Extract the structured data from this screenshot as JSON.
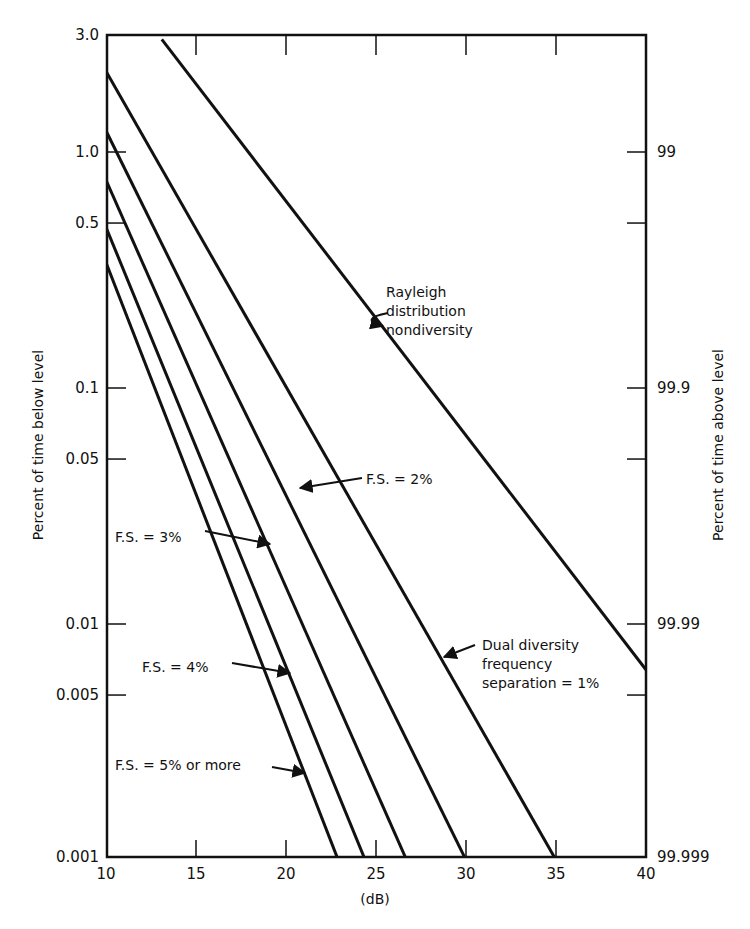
{
  "chart_data": {
    "type": "line",
    "title": "",
    "xlabel": "(dB)",
    "ylabel": "Percent of time below level",
    "ylabel_right": "Percent of time above level",
    "xlim": [
      10,
      40
    ],
    "ylim": [
      0.001,
      3.0
    ],
    "yscale": "log",
    "grid": false,
    "x_ticks": [
      10,
      15,
      20,
      25,
      30,
      35,
      40
    ],
    "x_tick_labels": [
      "10",
      "15",
      "20",
      "25",
      "30",
      "35",
      "40"
    ],
    "y_ticks": [
      3.0,
      1.0,
      0.5,
      0.1,
      0.05,
      0.01,
      0.005,
      0.001
    ],
    "y_tick_labels": [
      "3.0",
      "1.0",
      "0.5",
      "0.1",
      "0.05",
      "0.01",
      "0.005",
      "0.001"
    ],
    "y_right_ticks": [
      1.0,
      0.5,
      0.1,
      0.05,
      0.01,
      0.005,
      0.001
    ],
    "y_right_tick_labels": [
      "99",
      "",
      "99.9",
      "",
      "99.99",
      "",
      "99.999"
    ],
    "series": [
      {
        "name": "Rayleigh distribution nondiversity",
        "x": [
          13.1,
          40
        ],
        "y": [
          3.0,
          0.0064
        ]
      },
      {
        "name": "Dual diversity frequency separation = 1%",
        "x": [
          10,
          35
        ],
        "y": [
          2.2,
          0.001
        ]
      },
      {
        "name": "F.S. = 2%",
        "x": [
          10,
          30
        ],
        "y": [
          1.23,
          0.001
        ]
      },
      {
        "name": "F.S. = 3%",
        "x": [
          10,
          26.7
        ],
        "y": [
          0.76,
          0.001
        ]
      },
      {
        "name": "F.S. = 4%",
        "x": [
          10,
          24.4
        ],
        "y": [
          0.48,
          0.001
        ]
      },
      {
        "name": "F.S. = 5% or more",
        "x": [
          10,
          22.9
        ],
        "y": [
          0.34,
          0.001
        ]
      }
    ],
    "annotations": [
      {
        "lines": [
          "Rayleigh",
          "distribution",
          "nondiversity"
        ],
        "text_x": 386,
        "text_y": 297,
        "arrow": [
          [
            388,
            313
          ],
          [
            358,
            319
          ],
          [
            383,
            326
          ]
        ]
      },
      {
        "lines": [
          "F.S. = 2%"
        ],
        "text_x": 366,
        "text_y": 484,
        "arrow": [
          [
            362,
            478
          ],
          [
            300,
            488
          ]
        ]
      },
      {
        "lines": [
          "F.S. = 3%"
        ],
        "text_x": 115,
        "text_y": 542,
        "arrow": [
          [
            205,
            531
          ],
          [
            270,
            544
          ]
        ]
      },
      {
        "lines": [
          "F.S. = 4%"
        ],
        "text_x": 142,
        "text_y": 672,
        "arrow": [
          [
            232,
            663
          ],
          [
            290,
            673
          ]
        ]
      },
      {
        "lines": [
          "F.S. = 5% or more"
        ],
        "text_x": 115,
        "text_y": 770,
        "arrow": [
          [
            272,
            767
          ],
          [
            305,
            773
          ]
        ]
      },
      {
        "lines": [
          "Dual diversity",
          "frequency",
          "separation = 1%"
        ],
        "text_x": 482,
        "text_y": 650,
        "arrow": [
          [
            475,
            645
          ],
          [
            444,
            657
          ]
        ]
      }
    ]
  }
}
